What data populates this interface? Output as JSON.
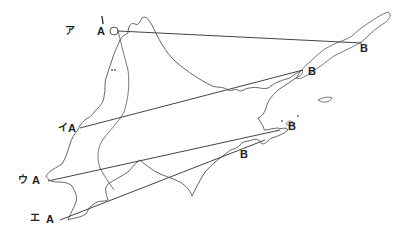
{
  "diagram": {
    "routes": [
      {
        "kana": "ア",
        "start": "A",
        "end": "B",
        "a": [
          113,
          31
        ],
        "b": [
          362,
          43
        ]
      },
      {
        "kana": "イ",
        "start": "A",
        "end": "B",
        "a": [
          80,
          128
        ],
        "b": [
          303,
          70
        ]
      },
      {
        "kana": "ウ",
        "start": "A",
        "end": "B",
        "a": [
          48,
          180
        ],
        "b": [
          280,
          130
        ]
      },
      {
        "kana": "エ",
        "start": "A",
        "end": "B",
        "a": [
          60,
          220
        ],
        "b": [
          265,
          140
        ]
      }
    ],
    "labels": {
      "r0_kana": "ア",
      "r0_a": "A",
      "r0_b": "B",
      "r1_kana": "イ",
      "r1_a": "A",
      "r1_b": "B",
      "r2_kana": "ウ",
      "r2_a": "A",
      "r2_b": "B",
      "r3_kana": "エ",
      "r3_a": "A",
      "r3_b": "B"
    },
    "colors": {
      "line": "#444444",
      "coast": "#555555"
    }
  }
}
